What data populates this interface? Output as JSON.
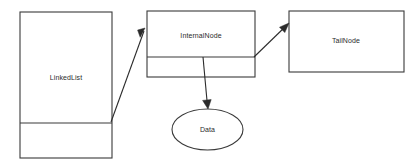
{
  "diagram": {
    "type": "uml-object-diagram",
    "background_color": "#ffffff",
    "stroke_color": "#3a3a3a",
    "text_color": "#2b2b2b",
    "nodes": [
      {
        "id": "linkedlist",
        "label": "LinkedList",
        "shape": "rectangle-two-compartment",
        "x": 20,
        "y": 12,
        "width": 92,
        "height": 146,
        "divider_y": 123,
        "label_x": 66,
        "label_y": 78
      },
      {
        "id": "internalnode",
        "label": "InternalNode",
        "shape": "rectangle-two-compartment",
        "x": 147,
        "y": 11,
        "width": 108,
        "height": 66,
        "divider_y": 57,
        "label_x": 201,
        "label_y": 36
      },
      {
        "id": "tailnode",
        "label": "TailNode",
        "shape": "rectangle",
        "x": 289,
        "y": 11,
        "width": 115,
        "height": 61,
        "label_x": 346,
        "label_y": 41
      },
      {
        "id": "data",
        "label": "Data",
        "shape": "ellipse",
        "cx": 207.5,
        "cy": 129.5,
        "rx": 35.5,
        "ry": 20.5,
        "label_x": 207.5,
        "label_y": 130
      }
    ],
    "connectors": [
      {
        "id": "linkedlist-to-internalnode",
        "from": "linkedlist",
        "to": "internalnode",
        "x1": 111,
        "y1": 122,
        "x2": 144,
        "y2": 31,
        "arrow": "end"
      },
      {
        "id": "internalnode-to-tailnode",
        "from": "internalnode",
        "to": "tailnode",
        "x1": 254,
        "y1": 57,
        "x2": 288,
        "y2": 24,
        "arrow": "end"
      },
      {
        "id": "internalnode-to-data",
        "from": "internalnode",
        "to": "data",
        "x1": 203,
        "y1": 57,
        "x2": 208,
        "y2": 108,
        "arrow": "end"
      }
    ]
  }
}
